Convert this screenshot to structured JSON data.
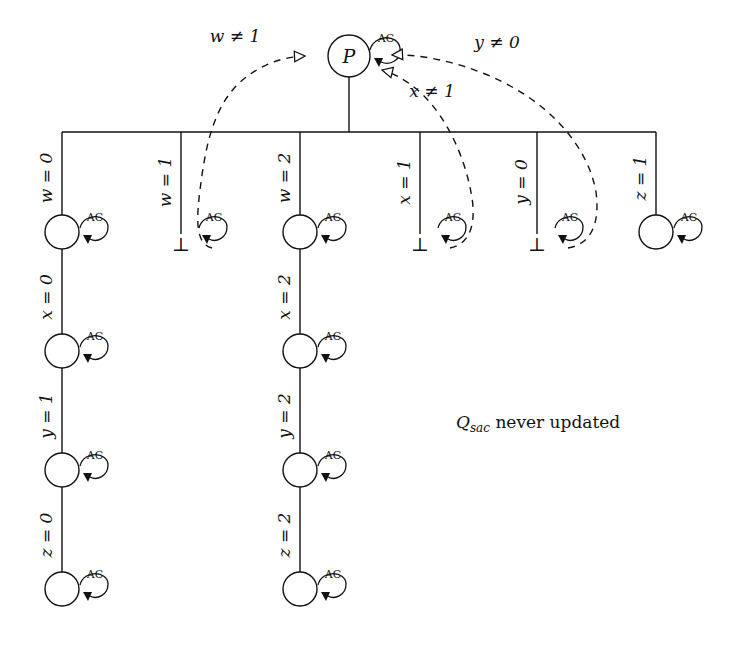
{
  "diagram": {
    "type": "search-tree-diagram",
    "root": {
      "label": "P",
      "self_loop": "AC"
    },
    "note": "Q_sac never updated",
    "note_display": "Qsac never updated",
    "colors": {
      "stroke": "#111111",
      "background": "#ffffff",
      "dashed_stroke": "#111111"
    },
    "root_incoming_edges": [
      {
        "label": "w ≠ 1",
        "from_branch": 1,
        "arrow_style": "hollow"
      },
      {
        "label": "x ≠ 1",
        "from_branch": 3,
        "arrow_style": "hollow"
      },
      {
        "label": "y ≠ 0",
        "from_branch": 4,
        "arrow_style": "hollow"
      }
    ],
    "branches": [
      {
        "id": 0,
        "root_label": "w = 0",
        "terminal": "node",
        "nodes": [
          {
            "self_loop": "AC"
          },
          {
            "self_loop": "AC"
          },
          {
            "self_loop": "AC"
          },
          {
            "self_loop": "AC"
          }
        ],
        "edge_labels": [
          "w = 0",
          "x = 0",
          "y = 1",
          "z = 0"
        ]
      },
      {
        "id": 1,
        "root_label": "w = 1",
        "terminal": "bottom",
        "terminal_symbol": "⊥",
        "self_loop": "AC",
        "edge_labels": [
          "w = 1"
        ]
      },
      {
        "id": 2,
        "root_label": "w = 2",
        "terminal": "node",
        "nodes": [
          {
            "self_loop": "AC"
          },
          {
            "self_loop": "AC"
          },
          {
            "self_loop": "AC"
          },
          {
            "self_loop": "AC"
          }
        ],
        "edge_labels": [
          "w = 2",
          "x = 2",
          "y = 2",
          "z = 2"
        ]
      },
      {
        "id": 3,
        "root_label": "x = 1",
        "terminal": "bottom",
        "terminal_symbol": "⊥",
        "self_loop": "AC",
        "edge_labels": [
          "x = 1"
        ]
      },
      {
        "id": 4,
        "root_label": "y = 0",
        "terminal": "bottom",
        "terminal_symbol": "⊥",
        "self_loop": "AC",
        "edge_labels": [
          "y = 0"
        ]
      },
      {
        "id": 5,
        "root_label": "z = 1",
        "terminal": "node",
        "nodes": [
          {
            "self_loop": "AC"
          }
        ],
        "edge_labels": [
          "z = 1"
        ]
      }
    ],
    "self_loop_label": "AC",
    "bottom_symbol": "⊥"
  }
}
